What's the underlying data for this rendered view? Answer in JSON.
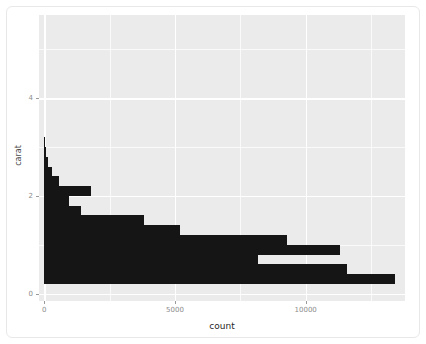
{
  "figure": {
    "background_color": "#ffffff",
    "panel_color": "#ebebeb",
    "bar_color": "#151515",
    "grid_color": "#ffffff"
  },
  "axis": {
    "x_title": "count",
    "y_title": "carat",
    "x_ticks": [
      {
        "label": "0",
        "value": 0
      },
      {
        "label": "5000",
        "value": 5000
      },
      {
        "label": "10000",
        "value": 10000
      }
    ],
    "y_ticks": [
      {
        "label": "0",
        "value": 0
      },
      {
        "label": "2",
        "value": 2
      },
      {
        "label": "4",
        "value": 4
      }
    ]
  },
  "chart_data": {
    "type": "bar",
    "orientation": "horizontal",
    "title": "",
    "xlabel": "count",
    "ylabel": "carat",
    "xlim": [
      -200,
      13800
    ],
    "ylim": [
      -0.15,
      5.7
    ],
    "grid": true,
    "legend": "none",
    "bin_width": 0.2,
    "x_major_ticks": [
      0,
      5000,
      10000
    ],
    "x_minor_ticks": [
      2500,
      7500,
      12500
    ],
    "y_major_ticks": [
      0,
      2,
      4
    ],
    "y_minor_ticks": [
      1,
      3,
      5
    ],
    "categories": [
      0.3,
      0.5,
      0.7,
      0.9,
      1.1,
      1.3,
      1.5,
      1.7,
      1.9,
      2.1,
      2.3,
      2.5,
      2.7,
      2.9,
      3.1,
      3.3,
      3.5,
      3.7,
      3.9,
      4.1,
      4.3,
      4.5,
      4.7,
      4.9,
      5.1
    ],
    "values": [
      13400,
      11600,
      8160,
      8160,
      11300,
      5200,
      5200,
      3820,
      1400,
      1400,
      560,
      560,
      310,
      310,
      150,
      150,
      60,
      60,
      40,
      12,
      12,
      6,
      4,
      2,
      2
    ],
    "bars": [
      {
        "y_low": 0.2,
        "y_high": 0.4,
        "count": 13400
      },
      {
        "y_low": 0.4,
        "y_high": 0.6,
        "count": 11600
      },
      {
        "y_low": 0.6,
        "y_high": 0.8,
        "count": 8160
      },
      {
        "y_low": 0.8,
        "y_high": 1.0,
        "count": 11300
      },
      {
        "y_low": 1.0,
        "y_high": 1.2,
        "count": 9280
      },
      {
        "y_low": 1.2,
        "y_high": 1.4,
        "count": 5200
      },
      {
        "y_low": 1.4,
        "y_high": 1.6,
        "count": 3820
      },
      {
        "y_low": 1.6,
        "y_high": 1.8,
        "count": 1400
      },
      {
        "y_low": 1.8,
        "y_high": 2.0,
        "count": 960
      },
      {
        "y_low": 2.0,
        "y_high": 2.2,
        "count": 1800
      },
      {
        "y_low": 2.2,
        "y_high": 2.4,
        "count": 560
      },
      {
        "y_low": 2.4,
        "y_high": 2.6,
        "count": 310
      },
      {
        "y_low": 2.6,
        "y_high": 2.8,
        "count": 150
      },
      {
        "y_low": 2.8,
        "y_high": 3.0,
        "count": 60
      },
      {
        "y_low": 3.0,
        "y_high": 3.2,
        "count": 40
      }
    ]
  }
}
